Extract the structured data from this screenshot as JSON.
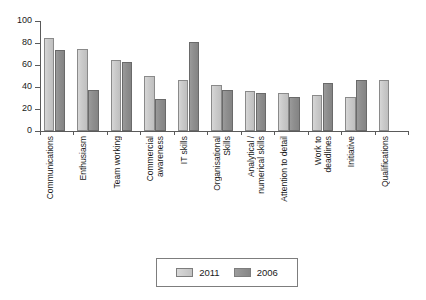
{
  "chart_data": {
    "type": "bar",
    "title": "",
    "subtitle": "",
    "xlabel": "",
    "ylabel": "",
    "ylim": [
      0,
      100
    ],
    "yticks": [
      0,
      20,
      40,
      60,
      80,
      100
    ],
    "grid": false,
    "legend_position": "bottom",
    "orientation": "vertical",
    "grouping": "grouped",
    "categories": [
      "Communications",
      "Enthusiasm",
      "Team working",
      "Commercial awareness",
      "IT skills",
      "Organisational Skills",
      "Analytical / numerical skills",
      "Attention to detail",
      "Work to deadlines",
      "Initiative",
      "Qualifications"
    ],
    "category_lines": [
      [
        "Communications"
      ],
      [
        "Enthusiasm"
      ],
      [
        "Team working"
      ],
      [
        "Commercial",
        "awareness"
      ],
      [
        "IT skills"
      ],
      [
        "Organisational",
        "Skills"
      ],
      [
        "Analytical /",
        "numerical skills"
      ],
      [
        "Attention to detail"
      ],
      [
        "Work to",
        "deadlines"
      ],
      [
        "Initiative"
      ],
      [
        "Qualifications"
      ]
    ],
    "series": [
      {
        "name": "2011",
        "color": "#cccccc",
        "values": [
          85,
          75,
          65,
          50,
          46,
          42,
          36,
          35,
          33,
          31,
          46
        ]
      },
      {
        "name": "2006",
        "color": "#8e8e8e",
        "values": [
          74,
          37,
          63,
          29,
          81,
          37,
          35,
          31,
          44,
          46,
          null
        ]
      }
    ]
  },
  "legend": {
    "items": [
      {
        "label": "2011",
        "swatch": "light-gray-swatch"
      },
      {
        "label": "2006",
        "swatch": "dark-gray-swatch"
      }
    ]
  },
  "axis": {
    "y_tick_labels": [
      "100",
      "80",
      "60",
      "40",
      "20",
      "0"
    ]
  }
}
